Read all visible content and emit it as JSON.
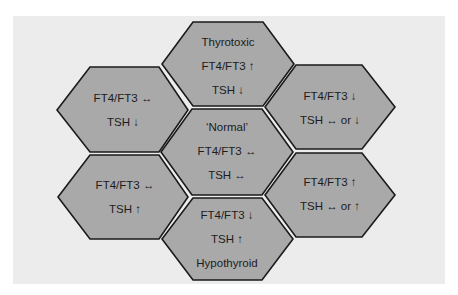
{
  "diagram": {
    "colors": {
      "background": "#ececec",
      "hex_fill": "#a9a9a9",
      "hex_stroke": "#1a1a1a",
      "text": "#1c1c1c"
    },
    "cells": [
      {
        "id": "top",
        "position": "top",
        "lines": [
          "Thyrotoxic",
          "FT4/FT3 ↑",
          "TSH ↓"
        ]
      },
      {
        "id": "upper-left",
        "position": "upper-left",
        "lines": [
          "FT4/FT3 ↔",
          "TSH ↓"
        ]
      },
      {
        "id": "upper-right",
        "position": "upper-right",
        "lines": [
          "FT4/FT3 ↓",
          "TSH ↔ or ↓"
        ]
      },
      {
        "id": "center",
        "position": "center",
        "lines": [
          "‘Normal’",
          "FT4/FT3 ↔",
          "TSH ↔"
        ]
      },
      {
        "id": "lower-left",
        "position": "lower-left",
        "lines": [
          "FT4/FT3 ↔",
          "TSH ↑"
        ]
      },
      {
        "id": "lower-right",
        "position": "lower-right",
        "lines": [
          "FT4/FT3 ↑",
          "TSH ↔ or ↑"
        ]
      },
      {
        "id": "bottom",
        "position": "bottom",
        "lines": [
          "FT4/FT3 ↓",
          "TSH ↑",
          "Hypothyroid"
        ]
      }
    ]
  }
}
